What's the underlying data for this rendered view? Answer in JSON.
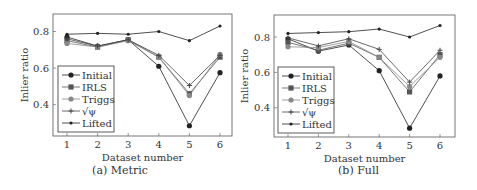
{
  "chart_data": [
    {
      "type": "line",
      "title": "",
      "caption": "(a) Metric",
      "xlabel": "Dataset number",
      "ylabel": "Inlier ratio",
      "x": [
        1,
        2,
        3,
        4,
        5,
        6
      ],
      "xticks": [
        "1",
        "2",
        "3",
        "4",
        "5",
        "6"
      ],
      "yticks": [
        "0.4",
        "0.6",
        "0.8"
      ],
      "ylim": [
        0.24,
        0.88
      ],
      "grid": false,
      "legend_position": "lower left",
      "series": [
        {
          "name": "Initial",
          "marker": "circle",
          "color": "#222222",
          "values": [
            0.77,
            0.72,
            0.755,
            0.61,
            0.285,
            0.575
          ]
        },
        {
          "name": "IRLS",
          "marker": "square",
          "color": "#555555",
          "values": [
            0.75,
            0.715,
            0.755,
            0.66,
            0.46,
            0.66
          ]
        },
        {
          "name": "Triggs",
          "marker": "circle-gray",
          "color": "#888888",
          "values": [
            0.735,
            0.715,
            0.75,
            0.66,
            0.45,
            0.675
          ]
        },
        {
          "name": "√ψ",
          "marker": "star",
          "color": "#444444",
          "values": [
            0.76,
            0.72,
            0.755,
            0.67,
            0.505,
            0.67
          ]
        },
        {
          "name": "Lifted",
          "marker": "diamond",
          "color": "#222222",
          "values": [
            0.785,
            0.79,
            0.785,
            0.8,
            0.75,
            0.83
          ]
        }
      ]
    },
    {
      "type": "line",
      "title": "",
      "caption": "(b) Full",
      "xlabel": "Dataset number",
      "ylabel": "Inlier ratio",
      "x": [
        1,
        2,
        3,
        4,
        5,
        6
      ],
      "xticks": [
        "1",
        "2",
        "3",
        "4",
        "5",
        "6"
      ],
      "yticks": [
        "0.4",
        "0.6",
        "0.8"
      ],
      "ylim": [
        0.24,
        0.91
      ],
      "grid": false,
      "legend_position": "lower left",
      "series": [
        {
          "name": "Initial",
          "marker": "circle",
          "color": "#222222",
          "values": [
            0.79,
            0.72,
            0.755,
            0.61,
            0.285,
            0.58
          ]
        },
        {
          "name": "IRLS",
          "marker": "square",
          "color": "#555555",
          "values": [
            0.77,
            0.725,
            0.765,
            0.685,
            0.49,
            0.7
          ]
        },
        {
          "name": "Triggs",
          "marker": "circle-gray",
          "color": "#888888",
          "values": [
            0.745,
            0.74,
            0.775,
            0.685,
            0.52,
            0.685
          ]
        },
        {
          "name": "√ψ",
          "marker": "star",
          "color": "#444444",
          "values": [
            0.795,
            0.75,
            0.79,
            0.73,
            0.545,
            0.725
          ]
        },
        {
          "name": "Lifted",
          "marker": "diamond",
          "color": "#222222",
          "values": [
            0.82,
            0.825,
            0.83,
            0.845,
            0.8,
            0.865
          ]
        }
      ]
    }
  ],
  "captions": {
    "a": "(a) Metric",
    "b": "(b) Full"
  },
  "axis": {
    "xlabel": "Dataset number",
    "ylabel": "Inlier ratio"
  }
}
